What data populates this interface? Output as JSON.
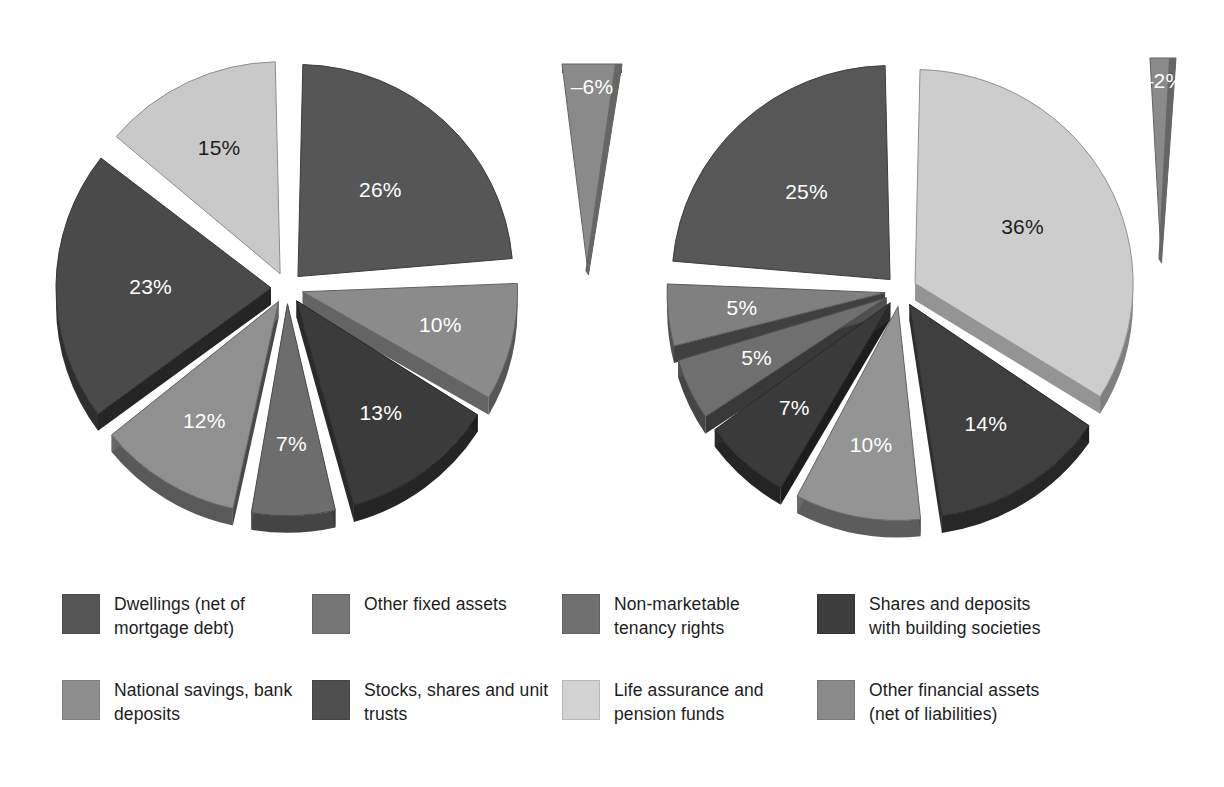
{
  "chart_data": [
    {
      "type": "pie",
      "title": "",
      "name": "left-pie",
      "exploded": true,
      "three_d": true,
      "start_angle_deg": 0,
      "categories": [
        "Dwellings (net of mortgage debt)",
        "Other fixed assets",
        "Shares and deposits with building societies",
        "Non-marketable tenancy rights",
        "National savings, bank deposits",
        "Stocks, shares and unit trusts",
        "Life assurance and pension funds",
        "Other financial assets (net of liabilities)"
      ],
      "values": [
        26,
        10,
        13,
        7,
        12,
        23,
        15,
        -6
      ],
      "labels": [
        "26%",
        "10%",
        "13%",
        "7%",
        "12%",
        "23%",
        "15%",
        "–6%"
      ],
      "colors": [
        "#565656",
        "#8b8b8b",
        "#3b3b3b",
        "#6d6d6d",
        "#909090",
        "#4a4a4a",
        "#c9c9c9",
        "#8a8a8a"
      ]
    },
    {
      "type": "pie",
      "title": "",
      "name": "right-pie",
      "exploded": true,
      "three_d": true,
      "start_angle_deg": 0,
      "categories": [
        "Life assurance and pension funds",
        "Shares and deposits with building societies",
        "National savings, bank deposits",
        "Stocks, shares and unit trusts",
        "Other financial assets (net of liabilities)",
        "Non-marketable tenancy rights",
        "Dwellings (net of mortgage debt)",
        "Other fixed assets"
      ],
      "values": [
        36,
        14,
        10,
        7,
        5,
        5,
        25,
        -2
      ],
      "labels": [
        "36%",
        "14%",
        "10%",
        "7%",
        "5%",
        "5%",
        "25%",
        "–2%"
      ],
      "colors": [
        "#cdcdcd",
        "#3f3f3f",
        "#949494",
        "#3a3a3a",
        "#6f6f6f",
        "#808080",
        "#575757",
        "#8a8a8a"
      ]
    }
  ],
  "left_chart": {
    "slices": [
      {
        "label": "26%",
        "value": 26,
        "color": "#565656",
        "label_color": "light"
      },
      {
        "label": "10%",
        "value": 10,
        "color": "#8b8b8b",
        "label_color": "light"
      },
      {
        "label": "13%",
        "value": 13,
        "color": "#3b3b3b",
        "label_color": "light"
      },
      {
        "label": "7%",
        "value": 7,
        "color": "#6d6d6d",
        "label_color": "light"
      },
      {
        "label": "12%",
        "value": 12,
        "color": "#909090",
        "label_color": "light"
      },
      {
        "label": "23%",
        "value": 23,
        "color": "#4a4a4a",
        "label_color": "light"
      },
      {
        "label": "15%",
        "value": 15,
        "color": "#c9c9c9",
        "label_color": "dark"
      }
    ],
    "detached": {
      "label": "–6%",
      "value": -6,
      "color": "#8a8a8a",
      "label_color": "light"
    }
  },
  "right_chart": {
    "slices": [
      {
        "label": "36%",
        "value": 36,
        "color": "#cdcdcd",
        "label_color": "dark"
      },
      {
        "label": "14%",
        "value": 14,
        "color": "#3f3f3f",
        "label_color": "light"
      },
      {
        "label": "10%",
        "value": 10,
        "color": "#949494",
        "label_color": "light"
      },
      {
        "label": "7%",
        "value": 7,
        "color": "#3a3a3a",
        "label_color": "light"
      },
      {
        "label": "5%",
        "value": 5,
        "color": "#6f6f6f",
        "label_color": "light"
      },
      {
        "label": "5%",
        "value": 5,
        "color": "#808080",
        "label_color": "light"
      },
      {
        "label": "25%",
        "value": 25,
        "color": "#575757",
        "label_color": "light"
      }
    ],
    "detached": {
      "label": "–2%",
      "value": -2,
      "color": "#8a8a8a",
      "label_color": "light"
    }
  },
  "legend": {
    "items": [
      {
        "label": "Dwellings (net of mortgage debt)",
        "color": "#565656"
      },
      {
        "label": "Other fixed assets",
        "color": "#767676"
      },
      {
        "label": "Non-marketable tenancy rights",
        "color": "#6f6f6f"
      },
      {
        "label": "Shares and deposits with building societies",
        "color": "#3d3d3d"
      },
      {
        "label": "National savings, bank deposits",
        "color": "#8e8e8e"
      },
      {
        "label": "Stocks, shares and unit trusts",
        "color": "#4f4f4f"
      },
      {
        "label": "Life assurance and pension funds",
        "color": "#d2d2d2"
      },
      {
        "label": "Other financial assets (net of liabilities)",
        "color": "#8a8a8a"
      }
    ]
  }
}
